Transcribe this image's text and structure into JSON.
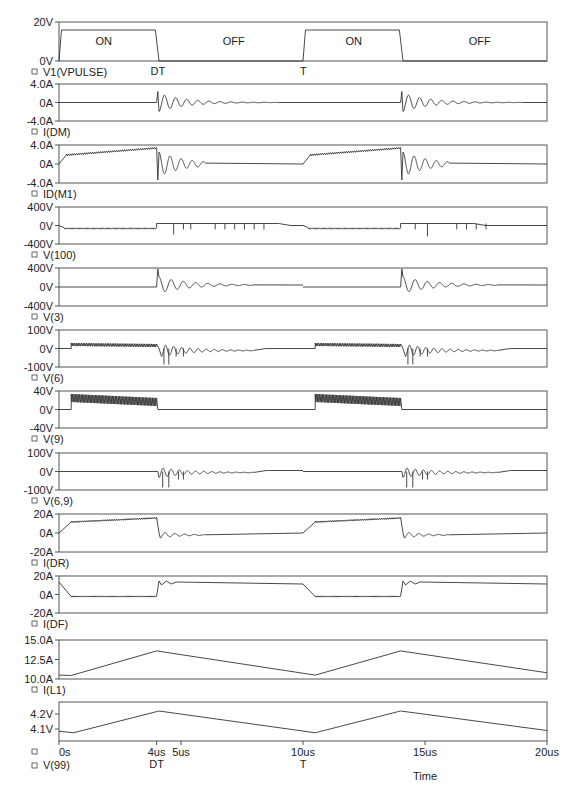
{
  "chart_data": {
    "type": "line",
    "title": "",
    "xlabel": "Time",
    "xlim": [
      0,
      20
    ],
    "x_unit": "us",
    "x_ticks": [
      {
        "value": 0,
        "label": "0s"
      },
      {
        "value": 4,
        "label": "4us"
      },
      {
        "value": 5,
        "label": "5us"
      },
      {
        "value": 10,
        "label": "10us"
      },
      {
        "value": 15,
        "label": "15us"
      },
      {
        "value": 20,
        "label": "20us"
      }
    ],
    "x_annotations": [
      {
        "value": 4,
        "label": "DT"
      },
      {
        "value": 10,
        "label": "T"
      }
    ],
    "panels": [
      {
        "name": "V1(VPULSE)",
        "yticks": [
          "20V",
          "0V"
        ],
        "ylim": [
          0,
          20
        ],
        "annotations": [
          {
            "x": 2,
            "label": "ON"
          },
          {
            "x": 7,
            "label": "OFF"
          },
          {
            "x": 12,
            "label": "ON"
          },
          {
            "x": 17,
            "label": "OFF"
          }
        ],
        "x": [
          0,
          0.1,
          4,
          4.1,
          10,
          10.1,
          14,
          14.1,
          20
        ],
        "y": [
          0,
          15,
          15,
          0,
          0,
          15,
          15,
          0,
          0
        ]
      },
      {
        "name": "I(DM)",
        "yticks": [
          "4.0A",
          "0A",
          "-4.0A"
        ],
        "ylim": [
          -4,
          4
        ],
        "description": "zero during ON, damped oscillation after turn-off at 4us and 14us (peak ~3A)"
      },
      {
        "name": "ID(M1)",
        "yticks": [
          "4.0A",
          "0A",
          "-4.0A"
        ],
        "ylim": [
          -4,
          4
        ],
        "x": [
          0,
          0.3,
          4,
          4.05,
          10,
          10.3,
          14,
          14.05,
          20
        ],
        "y": [
          0,
          2.5,
          3.8,
          -2.5,
          0,
          2.5,
          3.8,
          -2.5,
          0
        ],
        "description": "ramp from ~2.5A to ~3.8A during ON, ringing after turn-off"
      },
      {
        "name": "V(100)",
        "yticks": [
          "400V",
          "0V",
          "-400V"
        ],
        "ylim": [
          -400,
          400
        ],
        "description": "~-50V during ON, ~+50V after turn-off with negative spikes"
      },
      {
        "name": "V(3)",
        "yticks": [
          "400V",
          "0V",
          "-400V"
        ],
        "ylim": [
          -400,
          400
        ],
        "description": "0V during ON, spike ~400V at turn-off, damped ringing decaying to ~50V"
      },
      {
        "name": "V(6)",
        "yticks": [
          "100V",
          "0V",
          "-100V"
        ],
        "ylim": [
          -100,
          100
        ],
        "description": "~+15V ripple during ON, negative spikes to ~-70V after turn-off"
      },
      {
        "name": "V(9)",
        "yticks": [
          "40V",
          "0V",
          "-40V"
        ],
        "ylim": [
          -40,
          40
        ],
        "description": "high-frequency pulses 0-25V during ON, 0V during OFF"
      },
      {
        "name": "V(6,9)",
        "yticks": [
          "100V",
          "0V",
          "-100V"
        ],
        "ylim": [
          -100,
          100
        ],
        "description": "0V during ON, negative spikes to ~-80V after turn-off"
      },
      {
        "name": "I(DR)",
        "yticks": [
          "20A",
          "0A",
          "-20A"
        ],
        "ylim": [
          -20,
          20
        ],
        "x": [
          0,
          0.5,
          4,
          4.1,
          10,
          10.5,
          14,
          14.1,
          20
        ],
        "y": [
          0,
          11,
          14,
          0,
          0,
          11,
          14,
          0,
          0
        ]
      },
      {
        "name": "I(DF)",
        "yticks": [
          "20A",
          "0A",
          "-20A"
        ],
        "ylim": [
          -20,
          20
        ],
        "x": [
          0,
          0.5,
          4,
          4.1,
          10,
          10.5,
          14,
          14.1,
          20
        ],
        "y": [
          12,
          0,
          0,
          14,
          12,
          0,
          0,
          14,
          12
        ]
      },
      {
        "name": "I(L1)",
        "yticks": [
          "15.0A",
          "12.5A",
          "10.0A"
        ],
        "ylim": [
          10,
          15
        ],
        "x": [
          0,
          0.5,
          4,
          10.5,
          14,
          20
        ],
        "y": [
          10.5,
          10.5,
          13.7,
          10.5,
          13.7,
          10.8
        ]
      },
      {
        "name": "V(99)",
        "yticks": [
          "4.2V",
          "4.1V"
        ],
        "ylim": [
          4.05,
          4.25
        ],
        "x": [
          0,
          0.5,
          4,
          10.5,
          14,
          20
        ],
        "y": [
          4.08,
          4.07,
          4.23,
          4.07,
          4.23,
          4.09
        ]
      }
    ]
  },
  "labels": {
    "p0": "V1(VPULSE)",
    "p1": "I(DM)",
    "p2": "ID(M1)",
    "p3": "V(100)",
    "p4": "V(3)",
    "p5": "V(6)",
    "p6": "V(9)",
    "p7": "V(6,9)",
    "p8": "I(DR)",
    "p9": "I(DF)",
    "p10": "I(L1)",
    "p11": "V(99)",
    "on": "ON",
    "off": "OFF",
    "dt": "DT",
    "t": "T",
    "time": "Time",
    "x0": "0s",
    "x4": "4us",
    "x5": "5us",
    "x10": "10us",
    "x15": "15us",
    "x20": "20us"
  },
  "yticks": {
    "p0": [
      "20V",
      "0V"
    ],
    "p1": [
      "4.0A",
      "0A",
      "-4.0A"
    ],
    "p2": [
      "4.0A",
      "0A",
      "-4.0A"
    ],
    "p3": [
      "400V",
      "0V",
      "-400V"
    ],
    "p4": [
      "400V",
      "0V",
      "-400V"
    ],
    "p5": [
      "100V",
      "0V",
      "-100V"
    ],
    "p6": [
      "40V",
      "0V",
      "-40V"
    ],
    "p7": [
      "100V",
      "0V",
      "-100V"
    ],
    "p8": [
      "20A",
      "0A",
      "-20A"
    ],
    "p9": [
      "20A",
      "0A",
      "-20A"
    ],
    "p10": [
      "15.0A",
      "12.5A",
      "10.0A"
    ],
    "p11": [
      "4.2V",
      "4.1V"
    ]
  },
  "colors": {
    "trace": "#333333",
    "frame": "#555555",
    "background": "#ffffff"
  }
}
